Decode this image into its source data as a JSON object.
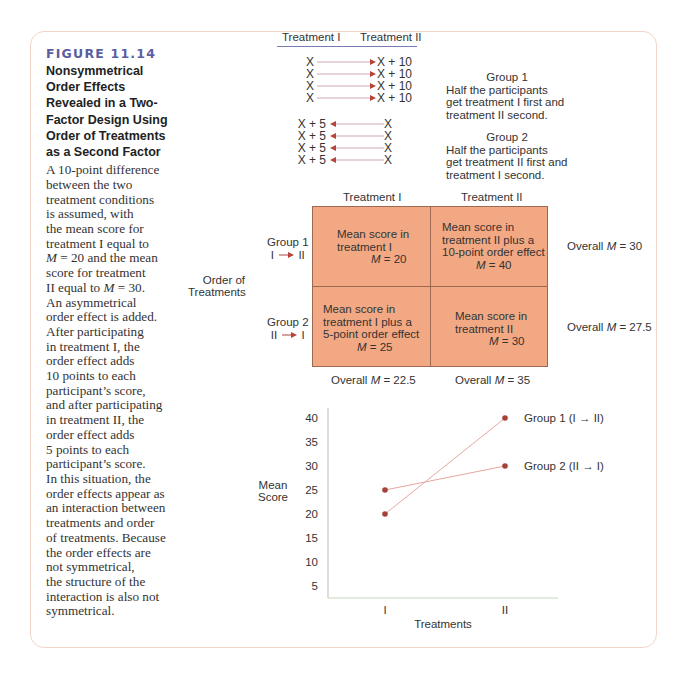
{
  "figure": {
    "number": "FIGURE 11.14",
    "title_lines": [
      "Nonsymmetrical",
      "Order Effects",
      "Revealed in a Two-",
      "Factor Design Using",
      "Order of Treatments",
      "as a Second Factor"
    ],
    "caption_lines": [
      "A 10-point difference",
      "between the two",
      "treatment conditions",
      "is assumed, with",
      "the mean score for",
      "treatment I equal to",
      "M = 20 and the mean",
      "score for treatment",
      "II equal to M = 30.",
      "An asymmetrical",
      "order effect is added.",
      "After participating",
      "in treatment I, the",
      "order effect adds",
      "10 points to each",
      "participant’s score,",
      "and after participating",
      "in treatment II, the",
      "order effect adds",
      "5 points to each",
      "participant’s score.",
      "In this situation, the",
      "order effects appear as",
      "an interaction between",
      "treatments and order",
      "of treatments. Because",
      "the order effects are",
      "not symmetrical,",
      "the structure of the",
      "interaction is also not",
      "symmetrical."
    ]
  },
  "design": {
    "head_left": "Treatment I",
    "head_right": "Treatment II",
    "group1_rows": [
      {
        "left": "X",
        "right": "X + 10"
      },
      {
        "left": "X",
        "right": "X + 10"
      },
      {
        "left": "X",
        "right": "X + 10"
      },
      {
        "left": "X",
        "right": "X + 10"
      }
    ],
    "group2_rows": [
      {
        "left": "X + 5",
        "right": "X"
      },
      {
        "left": "X + 5",
        "right": "X"
      },
      {
        "left": "X + 5",
        "right": "X"
      },
      {
        "left": "X + 5",
        "right": "X"
      }
    ],
    "group1_desc": {
      "title": "Group 1",
      "lines": [
        "Half the participants",
        "get treatment I first and",
        "treatment II second."
      ]
    },
    "group2_desc": {
      "title": "Group 2",
      "lines": [
        "Half the participants",
        "get treatment II first and",
        "treatment I second."
      ]
    }
  },
  "matrix": {
    "col_headers": [
      "Treatment I",
      "Treatment II"
    ],
    "row_factor": [
      "Order of",
      "Treatments"
    ],
    "rows": [
      {
        "label": "Group 1",
        "order": "I → II",
        "order_from": "I",
        "order_to": "II",
        "cells": [
          {
            "lines": [
              "Mean score in",
              "treatment I"
            ],
            "m_label": "M",
            "m_value": "= 20"
          },
          {
            "lines": [
              "Mean score in",
              "treatment II plus a",
              "10-point order effect"
            ],
            "m_label": "M",
            "m_value": "= 40"
          }
        ],
        "overall_label": "Overall",
        "overall_m": "M",
        "overall_value": "= 30"
      },
      {
        "label": "Group 2",
        "order": "II → I",
        "order_from": "II",
        "order_to": "I",
        "cells": [
          {
            "lines": [
              "Mean score in",
              "treatment I plus a",
              "5-point order effect"
            ],
            "m_label": "M",
            "m_value": " = 25"
          },
          {
            "lines": [
              "Mean score in",
              "treatment II"
            ],
            "m_label": "M",
            "m_value": "= 30"
          }
        ],
        "overall_label": "Overall",
        "overall_m": "M",
        "overall_value": "= 27.5"
      }
    ],
    "col_overall": [
      {
        "label": "Overall",
        "m": "M",
        "value": "= 22.5"
      },
      {
        "label": "Overall",
        "m": "M",
        "value": "= 35"
      }
    ]
  },
  "colors": {
    "cell_fill": "#f2a883",
    "marker": "#a8403a",
    "line": "#e6a8a0",
    "title_blue": "#5b5ea1",
    "arrow": "#b5453a"
  },
  "chart_data": {
    "type": "line",
    "title": "",
    "xlabel": "Treatments",
    "ylabel": "Mean Score",
    "categories": [
      "I",
      "II"
    ],
    "yticks": [
      5,
      10,
      15,
      20,
      25,
      30,
      35,
      40
    ],
    "ylim": [
      2.5,
      42
    ],
    "grid": false,
    "legend": "inline-right",
    "series": [
      {
        "name": "Group 1 (I → II)",
        "values": [
          20,
          40
        ]
      },
      {
        "name": "Group 2 (II → I)",
        "values": [
          25,
          30
        ]
      }
    ]
  }
}
